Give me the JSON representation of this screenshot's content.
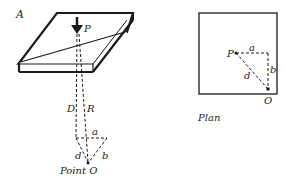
{
  "figure": {
    "slab_label": "A",
    "load_label": "P",
    "dashed_labels": {
      "D": "D",
      "R": "R",
      "a": "a",
      "b": "b",
      "d": "d"
    },
    "point_label": "Point O",
    "plan": {
      "title": "Plan",
      "labels": {
        "P": "P",
        "a": "a",
        "b": "b",
        "d": "d",
        "O": "O"
      }
    }
  },
  "colors": {
    "line": "#1a1a1a",
    "background": "#ffffff"
  }
}
